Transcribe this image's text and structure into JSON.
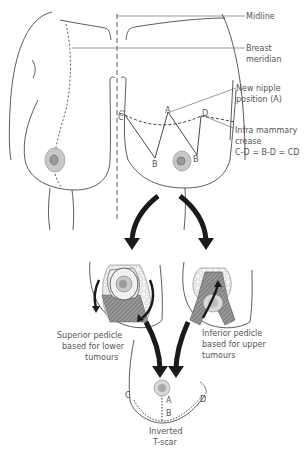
{
  "labels": {
    "midline": "Midline",
    "breast_meridian_1": "Breast",
    "breast_meridian_2": "meridian",
    "new_nipple_1": "New nipple",
    "new_nipple_2": "position (A)",
    "infra_1": "Infra mammary",
    "infra_2": "crease",
    "equation": "C-D = B-D = CD",
    "superior_1": "Superior pedicle",
    "superior_2": "based for lower",
    "superior_3": "tumours",
    "inferior_1": "Inferior pedicle",
    "inferior_2": "based for upper",
    "inferior_3": "tumours",
    "tscar_1": "Inverted",
    "tscar_2": "T-scar"
  },
  "points": {
    "A": "A",
    "B_left": "B",
    "B_right": "B",
    "C": "C",
    "D": "D",
    "A_final": "A",
    "B_final": "B",
    "C_final": "C",
    "D_final": "D"
  },
  "colors": {
    "line": "#333333",
    "arrow": "#1a1a1a",
    "areola": "#c8c8c8",
    "nipple": "#9a9a9a",
    "tissue": "#7a7a7a",
    "label": "#555555"
  }
}
